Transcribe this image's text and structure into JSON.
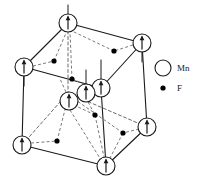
{
  "figure": {
    "colors": {
      "line": "#1a1a1a",
      "dashed_line": "#6b6b6b",
      "atom_fill": "#ffffff",
      "atom_stroke": "#1a1a1a",
      "fluorine_fill": "#000000",
      "text": "#1a1a1a",
      "background": "#ffffff"
    }
  },
  "legend": {
    "items": [
      {
        "symbol": "circle",
        "label": "Mn"
      },
      {
        "symbol": "dot",
        "label": "F"
      }
    ],
    "mn_label": "Mn",
    "f_label": "F"
  },
  "structure": {
    "cube_vertices": {
      "top_back": {
        "x": 68,
        "y": 23
      },
      "top_right": {
        "x": 142,
        "y": 43
      },
      "top_left": {
        "x": 24,
        "y": 67
      },
      "top_front": {
        "x": 101,
        "y": 88
      },
      "bot_back": {
        "x": 68,
        "y": 93
      },
      "bot_right": {
        "x": 147,
        "y": 127
      },
      "bot_left": {
        "x": 22,
        "y": 145
      },
      "bot_front": {
        "x": 106,
        "y": 166
      }
    },
    "mn_atoms": [
      {
        "id": "mn-top-back",
        "x": 68,
        "y": 23,
        "r": 9,
        "spin": "up",
        "site": "corner"
      },
      {
        "id": "mn-top-right",
        "x": 142,
        "y": 43,
        "r": 9,
        "spin": "up",
        "site": "corner"
      },
      {
        "id": "mn-top-left",
        "x": 24,
        "y": 67,
        "r": 9,
        "spin": "up",
        "site": "corner"
      },
      {
        "id": "mn-top-front",
        "x": 101,
        "y": 88,
        "r": 9,
        "spin": "up",
        "site": "corner"
      },
      {
        "id": "mn-body-center",
        "x": 86,
        "y": 93,
        "r": 9,
        "spin": "up",
        "site": "body-center"
      },
      {
        "id": "mn-inner-left",
        "x": 69,
        "y": 101,
        "r": 9,
        "spin": "up",
        "site": "body-center"
      },
      {
        "id": "mn-bot-right",
        "x": 147,
        "y": 127,
        "r": 9,
        "spin": "up",
        "site": "corner"
      },
      {
        "id": "mn-bot-left",
        "x": 22,
        "y": 145,
        "r": 9,
        "spin": "up",
        "site": "corner"
      },
      {
        "id": "mn-bot-front",
        "x": 106,
        "y": 166,
        "r": 9,
        "spin": "up",
        "site": "corner"
      }
    ],
    "f_atoms": [
      {
        "id": "f-top-upper-left",
        "x": 54,
        "y": 61,
        "r": 2.6
      },
      {
        "id": "f-top-upper-right",
        "x": 114,
        "y": 51,
        "r": 2.6
      },
      {
        "id": "f-top-mid",
        "x": 72,
        "y": 79,
        "r": 2.6
      },
      {
        "id": "f-inner-lower",
        "x": 95,
        "y": 115,
        "r": 2.6
      },
      {
        "id": "f-bottom-mid",
        "x": 123,
        "y": 133,
        "r": 2.6
      },
      {
        "id": "f-bottom-left",
        "x": 57,
        "y": 141,
        "r": 2.6
      }
    ],
    "counts": {
      "mn_total": 9,
      "f_total": 6
    }
  }
}
